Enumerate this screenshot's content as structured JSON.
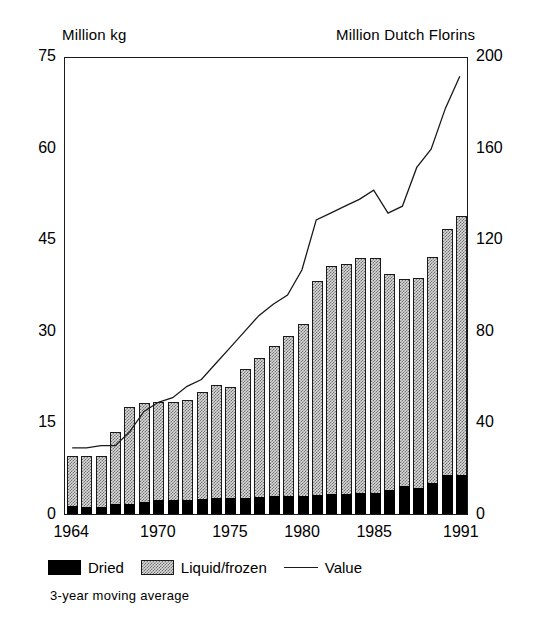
{
  "chart_data": {
    "type": "bar",
    "title": "",
    "subtitle": "",
    "ylabel": "Million kg",
    "ylabel_right": "Million Dutch Florins",
    "xlabel": "",
    "note": "3-year moving average",
    "grid": false,
    "legend_position": "bottom-left",
    "ylim": [
      0,
      75
    ],
    "yticks": [
      0,
      15,
      30,
      45,
      60,
      75
    ],
    "ylim_right": [
      0,
      200
    ],
    "yticks_right": [
      0,
      40,
      80,
      120,
      160,
      200
    ],
    "xticks_shown": [
      "1964",
      "1970",
      "1975",
      "1980",
      "1985",
      "1991"
    ],
    "categories": [
      "1964",
      "1965",
      "1966",
      "1967",
      "1968",
      "1969",
      "1970",
      "1971",
      "1972",
      "1973",
      "1974",
      "1975",
      "1976",
      "1977",
      "1978",
      "1979",
      "1980",
      "1981",
      "1982",
      "1983",
      "1984",
      "1985",
      "1986",
      "1987",
      "1988",
      "1989",
      "1990",
      "1991"
    ],
    "series": [
      {
        "name": "Dried",
        "axis": "left",
        "color": "#000000",
        "pattern": "solid",
        "values": [
          1.3,
          1.2,
          1.1,
          1.6,
          1.7,
          2.0,
          2.3,
          2.3,
          2.3,
          2.4,
          2.6,
          2.7,
          2.7,
          2.8,
          2.9,
          3.0,
          2.9,
          3.1,
          3.3,
          3.3,
          3.4,
          3.4,
          4.0,
          4.6,
          4.3,
          5.0,
          6.4,
          6.4
        ]
      },
      {
        "name": "Liquid/frozen",
        "axis": "left",
        "color": "#d9d9d9",
        "pattern": "hatched",
        "values": [
          8.2,
          8.3,
          8.4,
          11.9,
          15.9,
          16.1,
          16.0,
          16.1,
          16.3,
          17.5,
          18.5,
          18.1,
          21.1,
          22.7,
          24.6,
          26.1,
          28.2,
          35.1,
          37.3,
          37.6,
          38.5,
          38.5,
          35.3,
          33.9,
          34.4,
          37.1,
          40.3,
          42.4
        ]
      },
      {
        "name": "Total (Dried + Liquid/frozen)",
        "axis": "left",
        "stacked_total": true,
        "values": [
          9.5,
          9.5,
          9.5,
          13.5,
          17.6,
          18.1,
          18.3,
          18.4,
          18.6,
          19.9,
          21.1,
          20.8,
          23.8,
          25.5,
          27.5,
          29.1,
          31.1,
          38.2,
          40.6,
          40.9,
          41.9,
          41.9,
          39.3,
          38.5,
          38.7,
          42.1,
          46.7,
          48.8
        ]
      },
      {
        "name": "Value",
        "axis": "right",
        "color": "#1a1a1a",
        "type": "line",
        "values": [
          29,
          29,
          30,
          30,
          36,
          45,
          49,
          51,
          56,
          59,
          66,
          73,
          80,
          87,
          92,
          96,
          107,
          129,
          132,
          135,
          138,
          142,
          132,
          135,
          152,
          160,
          178,
          192
        ]
      }
    ],
    "legend": [
      {
        "label": "Dried",
        "swatch": "black-filled-rect"
      },
      {
        "label": "Liquid/frozen",
        "swatch": "hatched-rect"
      },
      {
        "label": "Value",
        "swatch": "line-segment"
      }
    ]
  }
}
